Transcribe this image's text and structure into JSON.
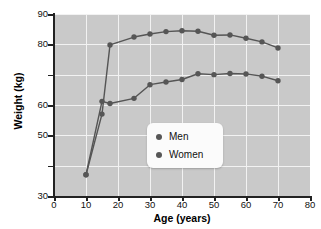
{
  "chart_data": {
    "type": "line",
    "title": "",
    "xlabel": "Age (years)",
    "ylabel": "Weight (kg)",
    "xlim": [
      0,
      80
    ],
    "ylim": [
      30,
      90
    ],
    "xticks": [
      0,
      10,
      20,
      30,
      40,
      50,
      60,
      70,
      80
    ],
    "xtick_labels": [
      "0",
      "10",
      "20",
      "30",
      "40",
      "50",
      "60",
      "70",
      "80"
    ],
    "yticks": [
      30,
      40,
      50,
      60,
      70,
      80,
      90
    ],
    "ytick_labels": [
      "30",
      "",
      "50",
      "60",
      "",
      "80",
      "90"
    ],
    "grid": true,
    "grid_color": "#f2f2f2",
    "plot_background": "#c9c9c9",
    "series_color": "#565656",
    "marker": "circle",
    "legend_position": "center",
    "series": [
      {
        "name": "Men",
        "x": [
          10,
          15,
          17.5,
          25,
          30,
          35,
          40,
          45,
          50,
          55,
          60,
          65,
          70
        ],
        "values": [
          37,
          57,
          79.8,
          82.4,
          83.4,
          84.2,
          84.5,
          84.3,
          83,
          83.1,
          82,
          80.8,
          78.8
        ]
      },
      {
        "name": "Women",
        "x": [
          10,
          15,
          17.5,
          25,
          30,
          35,
          40,
          45,
          50,
          55,
          60,
          65,
          70
        ],
        "values": [
          37,
          61.2,
          60.5,
          62.2,
          66.7,
          67.6,
          68.4,
          70.3,
          70,
          70.4,
          70.2,
          69.5,
          68
        ]
      }
    ],
    "legend": [
      {
        "label": "Men"
      },
      {
        "label": "Women"
      }
    ]
  }
}
